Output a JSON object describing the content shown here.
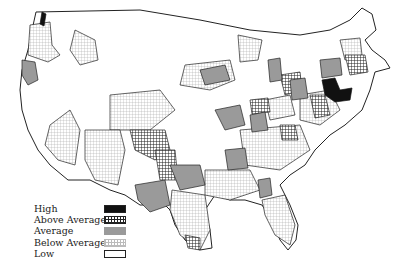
{
  "map": {
    "type": "choropleth",
    "region": "Contiguous United States",
    "units": "sub-state regions"
  },
  "legend": {
    "items": [
      {
        "label": "High",
        "pattern": "solid-black",
        "color": "#111111"
      },
      {
        "label": "Above Average",
        "pattern": "coarse-crosshatch",
        "color": "#222222"
      },
      {
        "label": "Average",
        "pattern": "solid-gray",
        "color": "#9a9a9a"
      },
      {
        "label": "Below Average",
        "pattern": "fine-grid",
        "color": "#bdbdbd"
      },
      {
        "label": "Low",
        "pattern": "white",
        "color": "#ffffff"
      }
    ]
  },
  "colors": {
    "outline": "#222222",
    "high": "#111111",
    "average": "#9a9a9a",
    "grid": "#b0b0b0"
  }
}
